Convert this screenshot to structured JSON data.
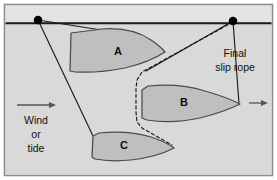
{
  "figure": {
    "frame": {
      "border_color": "#8c8c8c",
      "background_color": "#dededc",
      "outer_background": "#ffffff"
    },
    "colors": {
      "line": "#1a1a1a",
      "hull_fill": "#bfbfbf",
      "hull_stroke": "#4a4a4a",
      "quay_fill": "#dededc",
      "water_fill": "#d9d9d7",
      "text": "#101010",
      "arrow": "#555555",
      "bollard": "#000000"
    }
  },
  "quay": {
    "name": "quay-edge-line",
    "bollards": [
      {
        "label": "",
        "cx": 38,
        "cy": 20,
        "r": 4.2
      },
      {
        "label": "",
        "cx": 233,
        "cy": 21,
        "r": 4.2
      }
    ]
  },
  "vessels": [
    {
      "id": "A",
      "label": "A",
      "label_x": 118,
      "label_y": 52
    },
    {
      "id": "B",
      "label": "B",
      "label_x": 184,
      "label_y": 103
    },
    {
      "id": "C",
      "label": "C",
      "label_x": 124,
      "label_y": 146
    }
  ],
  "annotations": {
    "final_slip_rope": {
      "lines": [
        "Final",
        "slip rope"
      ],
      "x": 235,
      "y1": 54,
      "y2": 68
    },
    "wind_or_tide": {
      "lines": [
        "Wind",
        "or",
        "tide"
      ],
      "x": 36,
      "y1": 121,
      "y2": 135,
      "y3": 149
    }
  },
  "arrows": [
    {
      "name": "wind-tide-arrow",
      "x1": 17,
      "y1": 105,
      "x2": 56,
      "y2": 105
    },
    {
      "name": "vessel-heading-arrow",
      "x1": 248,
      "y1": 103,
      "x2": 268,
      "y2": 103
    }
  ],
  "ropes": {
    "solid": [
      {
        "name": "rope-bollard-left-to-vessel-a",
        "points": "38,20 100,29"
      },
      {
        "name": "rope-bollard-left-to-vessel-c",
        "points": "38,20 93,136"
      },
      {
        "name": "rope-bollard-right-to-vessel-b",
        "points": "233,21 238,103"
      },
      {
        "name": "rope-bollard-right-to-vessel-a-bow",
        "points": "233,21 148,70"
      }
    ],
    "dashed": {
      "name": "final-slip-rope-path",
      "points": "233,22 140,73 137,86 137,93 137,118 139,127 170,144"
    }
  }
}
